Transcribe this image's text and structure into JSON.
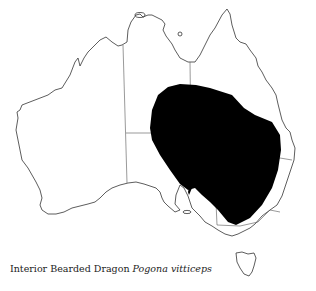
{
  "figure": {
    "type": "distribution map",
    "region": "Australia",
    "range_color": "#000000",
    "outline_color": "#333333"
  },
  "caption": {
    "common_name": "Interior Bearded Dragon",
    "scientific_name": "Pogona vitticeps"
  }
}
